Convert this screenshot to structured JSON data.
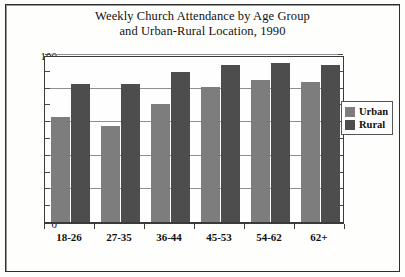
{
  "chart_data": {
    "type": "bar",
    "title": "Weekly Church Attendance by Age Group and Urban-Rural Location, 1990",
    "title_lines": [
      "Weekly Church Attendance by Age Group",
      "and Urban-Rural Location, 1990"
    ],
    "categories": [
      "18-26",
      "27-35",
      "36-44",
      "45-53",
      "54-62",
      "62+"
    ],
    "series": [
      {
        "name": "Urban",
        "color": "#7d7d7d",
        "values": [
          63,
          58,
          71,
          81,
          85,
          84
        ]
      },
      {
        "name": "Rural",
        "color": "#4d4d4d",
        "values": [
          83,
          83,
          90,
          94,
          95,
          94
        ]
      }
    ],
    "xlabel": "",
    "ylabel": "",
    "ylim": [
      0,
      100
    ],
    "yticks": [
      0,
      20,
      40,
      60,
      80,
      100
    ],
    "ytick_labels": [
      "0",
      "20",
      "40",
      "60",
      "80",
      "100"
    ],
    "yminor_step": 10,
    "grid": true,
    "legend_position": "right",
    "legend_entries": [
      "Urban",
      "Rural"
    ]
  }
}
